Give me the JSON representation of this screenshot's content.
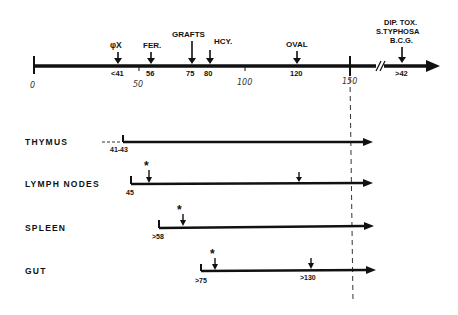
{
  "axis": {
    "ticks": [
      {
        "label": "0",
        "value": 0
      },
      {
        "label": "50",
        "value": 50
      },
      {
        "label": "100",
        "value": 100
      },
      {
        "label": "150",
        "value": 150
      }
    ],
    "events": [
      {
        "name": "φX",
        "value_label": "<41"
      },
      {
        "name": "FER.",
        "value_label": "56"
      },
      {
        "name": "GRAFTS",
        "value_label": "75"
      },
      {
        "name": "HCY.",
        "value_label": "80"
      },
      {
        "name": "OVAL",
        "value_label": "120"
      },
      {
        "name_lines": [
          "DIP. TOX.",
          "S.TYPHOSA",
          "B.C.G."
        ],
        "value_label": ">42"
      }
    ],
    "break_marker": "//"
  },
  "organs": [
    {
      "name": "THYMUS",
      "start_label": "41-43",
      "asterisk": false,
      "late_arrow_label": ""
    },
    {
      "name": "LYMPH NODES",
      "start_label": "45",
      "asterisk": true,
      "asterisk_symbol": "*",
      "late_arrow_label": ""
    },
    {
      "name": "SPLEEN",
      "start_label": ">58",
      "asterisk": true,
      "asterisk_symbol": "*",
      "late_arrow_label": ""
    },
    {
      "name": "GUT",
      "start_label": ">75",
      "asterisk": true,
      "asterisk_symbol": "*",
      "late_arrow_label": ">130"
    }
  ]
}
